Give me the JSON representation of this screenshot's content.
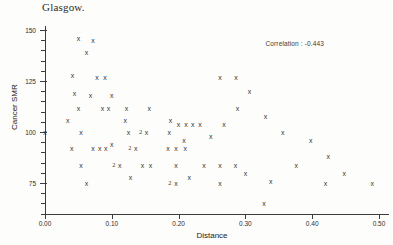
{
  "title": "Glasgow.",
  "annotation": "Correlation : -0.443",
  "axes": {
    "x": {
      "label": "Distance",
      "ticks": [
        "0.00",
        "0.10",
        "0.20",
        "0.30",
        "0.40",
        "0.50"
      ],
      "min": 0.0,
      "max": 0.5,
      "minor_per_major": 0
    },
    "y": {
      "label": "Cancer SMR",
      "ticks": [
        "150",
        "125",
        "100",
        "75"
      ],
      "min": 60,
      "max": 152,
      "minor_per_major": 5
    }
  },
  "chart_data": {
    "type": "scatter",
    "title": "Glasgow.",
    "xlabel": "Distance",
    "ylabel": "Cancer SMR",
    "xlim": [
      0.0,
      0.5
    ],
    "ylim": [
      60,
      152
    ],
    "grid": false,
    "legend": null,
    "marker": "x",
    "annotations": [
      {
        "text": "Correlation : -0.443",
        "x": 0.33,
        "y": 145
      }
    ],
    "points": [
      {
        "x": 0.0,
        "y": 100,
        "n": 1
      },
      {
        "x": 0.05,
        "y": 146,
        "n": 1
      },
      {
        "x": 0.072,
        "y": 145,
        "n": 1
      },
      {
        "x": 0.062,
        "y": 139,
        "n": 1
      },
      {
        "x": 0.041,
        "y": 128,
        "n": 1
      },
      {
        "x": 0.078,
        "y": 127,
        "n": 1
      },
      {
        "x": 0.09,
        "y": 127,
        "n": 1
      },
      {
        "x": 0.1,
        "y": 118,
        "n": 1
      },
      {
        "x": 0.044,
        "y": 119,
        "n": 1
      },
      {
        "x": 0.068,
        "y": 118,
        "n": 1
      },
      {
        "x": 0.05,
        "y": 112,
        "n": 1
      },
      {
        "x": 0.086,
        "y": 112,
        "n": 1
      },
      {
        "x": 0.095,
        "y": 112,
        "n": 1
      },
      {
        "x": 0.122,
        "y": 112,
        "n": 1
      },
      {
        "x": 0.156,
        "y": 112,
        "n": 1
      },
      {
        "x": 0.034,
        "y": 106,
        "n": 1
      },
      {
        "x": 0.12,
        "y": 106,
        "n": 1
      },
      {
        "x": 0.188,
        "y": 106,
        "n": 1
      },
      {
        "x": 0.2,
        "y": 104,
        "n": 1
      },
      {
        "x": 0.211,
        "y": 104,
        "n": 1
      },
      {
        "x": 0.221,
        "y": 104,
        "n": 1
      },
      {
        "x": 0.232,
        "y": 104,
        "n": 1
      },
      {
        "x": 0.054,
        "y": 100,
        "n": 1
      },
      {
        "x": 0.125,
        "y": 100,
        "n": 1
      },
      {
        "x": 0.152,
        "y": 100,
        "n": 2
      },
      {
        "x": 0.186,
        "y": 100,
        "n": 1
      },
      {
        "x": 0.262,
        "y": 127,
        "n": 1
      },
      {
        "x": 0.286,
        "y": 127,
        "n": 1
      },
      {
        "x": 0.208,
        "y": 96,
        "n": 1
      },
      {
        "x": 0.1,
        "y": 94,
        "n": 1
      },
      {
        "x": 0.04,
        "y": 92,
        "n": 1
      },
      {
        "x": 0.072,
        "y": 92,
        "n": 1
      },
      {
        "x": 0.082,
        "y": 92,
        "n": 1
      },
      {
        "x": 0.091,
        "y": 92,
        "n": 1
      },
      {
        "x": 0.136,
        "y": 92,
        "n": 2
      },
      {
        "x": 0.184,
        "y": 92,
        "n": 1
      },
      {
        "x": 0.196,
        "y": 92,
        "n": 1
      },
      {
        "x": 0.21,
        "y": 92,
        "n": 1
      },
      {
        "x": 0.306,
        "y": 120,
        "n": 1
      },
      {
        "x": 0.288,
        "y": 112,
        "n": 1
      },
      {
        "x": 0.268,
        "y": 104,
        "n": 1
      },
      {
        "x": 0.248,
        "y": 98,
        "n": 1
      },
      {
        "x": 0.33,
        "y": 108,
        "n": 1
      },
      {
        "x": 0.356,
        "y": 100,
        "n": 1
      },
      {
        "x": 0.398,
        "y": 96,
        "n": 1
      },
      {
        "x": 0.054,
        "y": 84,
        "n": 1
      },
      {
        "x": 0.112,
        "y": 84,
        "n": 2
      },
      {
        "x": 0.146,
        "y": 84,
        "n": 1
      },
      {
        "x": 0.158,
        "y": 84,
        "n": 1
      },
      {
        "x": 0.196,
        "y": 84,
        "n": 1
      },
      {
        "x": 0.238,
        "y": 84,
        "n": 1
      },
      {
        "x": 0.262,
        "y": 84,
        "n": 1
      },
      {
        "x": 0.285,
        "y": 84,
        "n": 1
      },
      {
        "x": 0.128,
        "y": 78,
        "n": 1
      },
      {
        "x": 0.216,
        "y": 78,
        "n": 1
      },
      {
        "x": 0.3,
        "y": 80,
        "n": 1
      },
      {
        "x": 0.062,
        "y": 75,
        "n": 1
      },
      {
        "x": 0.196,
        "y": 75,
        "n": 2
      },
      {
        "x": 0.262,
        "y": 75,
        "n": 1
      },
      {
        "x": 0.338,
        "y": 76,
        "n": 1
      },
      {
        "x": 0.376,
        "y": 84,
        "n": 1
      },
      {
        "x": 0.424,
        "y": 88,
        "n": 1
      },
      {
        "x": 0.448,
        "y": 80,
        "n": 1
      },
      {
        "x": 0.42,
        "y": 75,
        "n": 1
      },
      {
        "x": 0.49,
        "y": 75,
        "n": 1
      },
      {
        "x": 0.328,
        "y": 65,
        "n": 1
      }
    ]
  }
}
